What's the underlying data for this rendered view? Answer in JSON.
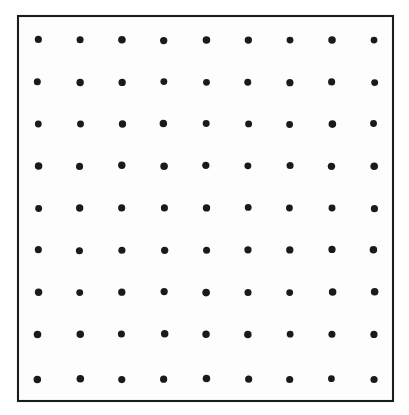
{
  "figure": {
    "canvas": {
      "width": 409,
      "height": 415,
      "background_color": "#ffffff"
    },
    "frame": {
      "name": "square-border",
      "x": 18,
      "y": 16,
      "width": 375,
      "height": 385,
      "stroke_color": "#1c1c1c",
      "stroke_width": 2,
      "fill_color": "#fdfdfd"
    },
    "dots": {
      "name": "dot-lattice",
      "rows": 9,
      "columns": 9,
      "total": 81,
      "radius": 3.6,
      "color": "#1a1a1a",
      "column_centers_x": [
        38,
        80,
        122,
        164,
        206,
        248,
        290,
        332,
        374
      ],
      "row_centers_y": [
        40,
        82,
        124,
        166,
        208,
        250,
        292,
        334,
        379
      ],
      "column_spacing": 42,
      "row_spacing": 42
    }
  },
  "chart_data": {
    "type": "scatter",
    "xlabel": "",
    "ylabel": "",
    "xlim": [
      18,
      393
    ],
    "ylim": [
      16,
      401
    ],
    "grid": false,
    "legend": false,
    "marker": "filled-circle",
    "marker_size": 7,
    "marker_color": "#1a1a1a",
    "x": [
      38,
      80,
      122,
      164,
      206,
      248,
      290,
      332,
      374,
      38,
      80,
      122,
      164,
      206,
      248,
      290,
      332,
      374,
      38,
      80,
      122,
      164,
      206,
      248,
      290,
      332,
      374,
      38,
      80,
      122,
      164,
      206,
      248,
      290,
      332,
      374,
      38,
      80,
      122,
      164,
      206,
      248,
      290,
      332,
      374,
      38,
      80,
      122,
      164,
      206,
      248,
      290,
      332,
      374,
      38,
      80,
      122,
      164,
      206,
      248,
      290,
      332,
      374,
      38,
      80,
      122,
      164,
      206,
      248,
      290,
      332,
      374,
      38,
      80,
      122,
      164,
      206,
      248,
      290,
      332,
      374
    ],
    "y": [
      40,
      40,
      40,
      40,
      40,
      40,
      40,
      40,
      40,
      82,
      82,
      82,
      82,
      82,
      82,
      82,
      82,
      82,
      124,
      124,
      124,
      124,
      124,
      124,
      124,
      124,
      124,
      166,
      166,
      166,
      166,
      166,
      166,
      166,
      166,
      166,
      208,
      208,
      208,
      208,
      208,
      208,
      208,
      208,
      208,
      250,
      250,
      250,
      250,
      250,
      250,
      250,
      250,
      250,
      292,
      292,
      292,
      292,
      292,
      292,
      292,
      292,
      292,
      334,
      334,
      334,
      334,
      334,
      334,
      334,
      334,
      334,
      379,
      379,
      379,
      379,
      379,
      379,
      379,
      379,
      379
    ]
  }
}
